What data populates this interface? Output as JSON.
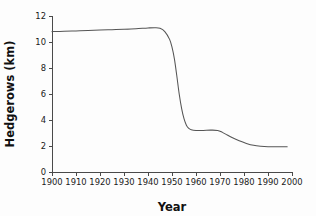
{
  "chart_data": {
    "type": "line",
    "title": "",
    "xlabel": "Year",
    "ylabel": "Hedgerows (km)",
    "xlim": [
      1900,
      2000
    ],
    "ylim": [
      0,
      12
    ],
    "grid": false,
    "legend": null,
    "xticks": [
      1900,
      1910,
      1920,
      1930,
      1940,
      1950,
      1960,
      1970,
      1980,
      1990,
      2000
    ],
    "xtick_labels": [
      "1900",
      "1910",
      "1920",
      "1930",
      "1940",
      "1950",
      "1960",
      "1970",
      "1980",
      "1990",
      "2000"
    ],
    "yticks": [
      0,
      2,
      4,
      6,
      8,
      10,
      12
    ],
    "ytick_labels": [
      "0",
      "2",
      "4",
      "6",
      "8",
      "10",
      "12"
    ],
    "line_color": "#555555",
    "series": [
      {
        "name": "Hedgerows",
        "x": [
          1900,
          1905,
          1910,
          1915,
          1920,
          1925,
          1930,
          1935,
          1940,
          1943,
          1945,
          1947,
          1949,
          1950,
          1951,
          1952,
          1953,
          1954,
          1955,
          1956,
          1957,
          1958,
          1960,
          1963,
          1966,
          1969,
          1971,
          1973,
          1975,
          1978,
          1981,
          1984,
          1987,
          1990,
          1994,
          1998
        ],
        "y": [
          10.8,
          10.82,
          10.85,
          10.88,
          10.92,
          10.95,
          10.98,
          11.02,
          11.08,
          11.1,
          11.05,
          10.8,
          10.2,
          9.6,
          8.7,
          7.4,
          6.0,
          4.9,
          4.1,
          3.6,
          3.35,
          3.25,
          3.2,
          3.2,
          3.22,
          3.2,
          3.05,
          2.85,
          2.65,
          2.4,
          2.2,
          2.05,
          1.98,
          1.95,
          1.95,
          1.95
        ]
      }
    ]
  },
  "axes": {
    "x_title": "Year",
    "y_title": "Hedgerows (km)"
  }
}
